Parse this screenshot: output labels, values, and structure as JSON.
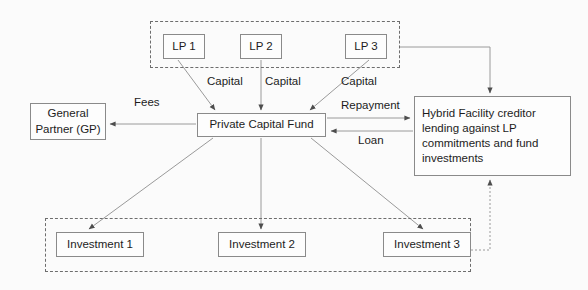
{
  "diagram": {
    "colors": {
      "background": "#fbfbfb",
      "node_border": "#8a8a8a",
      "node_fill": "#fdfdfd",
      "group_border": "#6d6d6d",
      "connector": "#9a9a9a",
      "text": "#1c1c1c"
    },
    "groups": [
      {
        "name": "lp-group",
        "style": "dashed"
      },
      {
        "name": "investments-group",
        "style": "dashed"
      }
    ],
    "limited_partners": [
      {
        "label": "LP 1"
      },
      {
        "label": "LP 2"
      },
      {
        "label": "LP 3"
      }
    ],
    "general_partner": {
      "label": "General Partner (GP)"
    },
    "fund": {
      "label": "Private Capital Fund"
    },
    "creditor": {
      "label": "Hybrid Facility creditor lending against LP commitments and fund investments"
    },
    "investments": [
      {
        "label": "Investment 1"
      },
      {
        "label": "Investment 2"
      },
      {
        "label": "Investment 3"
      }
    ],
    "edge_labels": {
      "capital_1": "Capital",
      "capital_2": "Capital",
      "capital_3": "Capital",
      "fees": "Fees",
      "repayment": "Repayment",
      "loan": "Loan"
    }
  }
}
